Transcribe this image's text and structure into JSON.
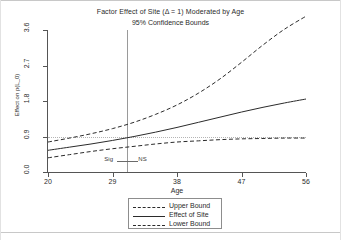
{
  "chart_data": {
    "type": "line",
    "title": "Factor Effect of Site (Δ = 1) Moderated by Age",
    "subtitle": "95% Confidence Bounds",
    "xlabel": "Age",
    "ylabel": "Effect on p(L_0)",
    "xlim": [
      20,
      56
    ],
    "ylim": [
      0.0,
      3.6
    ],
    "grid": false,
    "legend_position": "bottom-center",
    "x_ticks": [
      "20",
      "29",
      "38",
      "47",
      "56"
    ],
    "x_tick_values": [
      20,
      29,
      38,
      47,
      56
    ],
    "y_ticks": [
      "0.0",
      "0.9",
      "1.8",
      "2.7",
      "3.6"
    ],
    "y_tick_values": [
      0.0,
      0.9,
      1.8,
      2.7,
      3.6
    ],
    "x": [
      20,
      23,
      26,
      29,
      32,
      35,
      38,
      41,
      44,
      47,
      50,
      53,
      56
    ],
    "series": [
      {
        "name": "Upper Bound",
        "style": "dashed",
        "values": [
          0.76,
          0.86,
          0.97,
          1.1,
          1.26,
          1.46,
          1.7,
          2.0,
          2.36,
          2.78,
          3.22,
          3.62,
          3.95
        ]
      },
      {
        "name": "Effect of Site",
        "style": "solid",
        "values": [
          0.55,
          0.63,
          0.71,
          0.8,
          0.9,
          1.01,
          1.13,
          1.26,
          1.39,
          1.52,
          1.64,
          1.75,
          1.85
        ]
      },
      {
        "name": "Lower Bound",
        "style": "dashed",
        "values": [
          0.36,
          0.44,
          0.52,
          0.59,
          0.65,
          0.71,
          0.76,
          0.79,
          0.82,
          0.84,
          0.85,
          0.86,
          0.86
        ]
      }
    ],
    "reference_lines": [
      {
        "name": "null-effect-line",
        "orientation": "horizontal",
        "value": 0.9,
        "style": "dotted"
      },
      {
        "name": "significance-threshold-line",
        "orientation": "vertical",
        "value": 31.0,
        "style": "solid"
      }
    ],
    "annotations": [
      {
        "name": "significant-region-label",
        "text": "Sig",
        "x": 29.4,
        "y": 0.31
      },
      {
        "name": "not-significant-region-label",
        "text": "NS",
        "x": 32.6,
        "y": 0.31
      }
    ],
    "legend": [
      "Upper Bound",
      "Effect of Site",
      "Lower Bound"
    ]
  },
  "colors": {
    "line": "#2b2b2b",
    "axis": "#555555",
    "reference_vertical": "#9a9a9a",
    "reference_horizontal": "#b4b4b4",
    "background": "#ffffff"
  }
}
